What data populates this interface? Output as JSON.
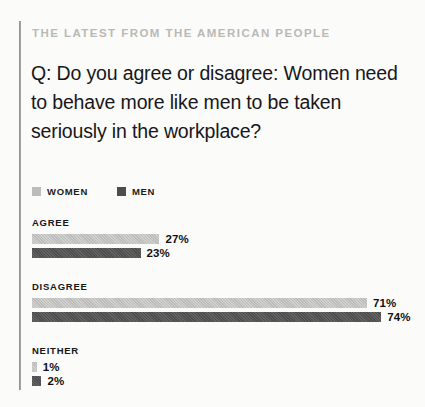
{
  "kicker": "THE LATEST FROM THE AMERICAN PEOPLE",
  "question": "Q: Do you agree or disagree: Women need to behave more like men to be taken seriously in the workplace?",
  "legend": {
    "women": {
      "label": "WOMEN",
      "color": "#bcbcba"
    },
    "men": {
      "label": "MEN",
      "color": "#4d4d4e"
    }
  },
  "groups": [
    {
      "label": "AGREE",
      "women_value": "27%",
      "men_value": "23%"
    },
    {
      "label": "DISAGREE",
      "women_value": "71%",
      "men_value": "74%"
    },
    {
      "label": "NEITHER",
      "women_value": "1%",
      "men_value": "2%"
    }
  ],
  "chart_data": {
    "type": "bar",
    "title": "Q: Do you agree or disagree: Women need to behave more like men to be taken seriously in the workplace?",
    "subtitle": "THE LATEST FROM THE AMERICAN PEOPLE",
    "orientation": "horizontal",
    "categories": [
      "AGREE",
      "DISAGREE",
      "NEITHER"
    ],
    "series": [
      {
        "name": "WOMEN",
        "color": "#bcbcba",
        "values": [
          27,
          71,
          1
        ],
        "unit": "%"
      },
      {
        "name": "MEN",
        "color": "#4d4d4e",
        "values": [
          23,
          74,
          2
        ],
        "unit": "%"
      }
    ],
    "xlabel": "",
    "ylabel": "",
    "xlim": [
      0,
      100
    ],
    "grid": false,
    "legend_position": "top-left",
    "data_labels": true,
    "pixels_per_percent": 4.72
  }
}
